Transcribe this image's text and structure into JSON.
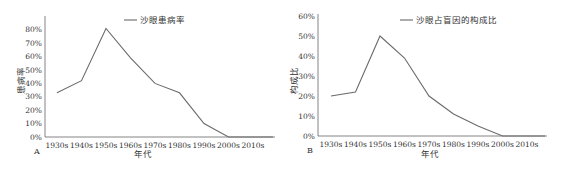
{
  "chart_data": [
    {
      "type": "line",
      "panel_label": "A",
      "title": "",
      "xlabel": "年代",
      "ylabel": "患病率",
      "categories": [
        "1930s",
        "1940s",
        "1950s",
        "1960s",
        "1970s",
        "1980s",
        "1990s",
        "2000s",
        "2010s"
      ],
      "series": [
        {
          "name": "沙眼患病率",
          "values": [
            33,
            42,
            81,
            59,
            40,
            33,
            10,
            0,
            0
          ]
        }
      ],
      "yticks": [
        "0%",
        "10%",
        "20%",
        "30%",
        "40%",
        "50%",
        "60%",
        "70%",
        "80%"
      ],
      "ylim": [
        0,
        88
      ],
      "grid": false,
      "legend_position": "top-center",
      "color": "#6b6b6b"
    },
    {
      "type": "line",
      "panel_label": "B",
      "title": "",
      "xlabel": "年代",
      "ylabel": "构成比",
      "categories": [
        "1930s",
        "1940s",
        "1950s",
        "1960s",
        "1970s",
        "1980s",
        "1990s",
        "2000s",
        "2010s"
      ],
      "series": [
        {
          "name": "沙眼占盲因的构成比",
          "values": [
            20,
            22,
            50,
            39,
            20,
            11,
            5,
            0,
            0
          ]
        }
      ],
      "yticks": [
        "0%",
        "10%",
        "20%",
        "30%",
        "40%",
        "50%",
        "60%"
      ],
      "ylim": [
        0,
        60
      ],
      "grid": false,
      "legend_position": "top-center",
      "color": "#6b6b6b"
    }
  ]
}
